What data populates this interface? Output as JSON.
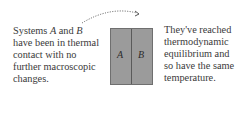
{
  "left_caption": {
    "line1_pre": "Systems ",
    "line1_a": "A",
    "line1_mid": " and ",
    "line1_b": "B",
    "line2": "have been in thermal",
    "line3": "contact with no",
    "line4": "further macroscopic",
    "line5": "changes."
  },
  "right_caption": {
    "line1": "They've reached",
    "line2": "thermodynamic",
    "line3": "equilibrium and",
    "line4": "so have the same",
    "line5": "temperature."
  },
  "systems": {
    "a_label": "A",
    "b_label": "B"
  },
  "colors": {
    "box_fill": "#9b9b9b",
    "box_border": "#6f6f6f",
    "text": "#3a3a3a"
  }
}
